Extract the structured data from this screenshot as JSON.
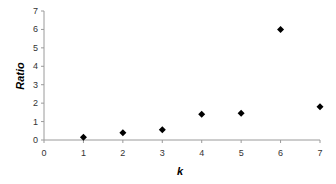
{
  "chart_data": {
    "type": "scatter",
    "title": "",
    "xlabel": "k",
    "ylabel": "Ratio",
    "x": [
      1,
      2,
      3,
      4,
      5,
      6,
      7
    ],
    "series": [
      {
        "name": "Ratio",
        "values": [
          0.15,
          0.4,
          0.55,
          1.4,
          1.45,
          6.0,
          1.8
        ],
        "marker": "diamond",
        "color": "#000000"
      }
    ],
    "xlim": [
      0,
      7
    ],
    "ylim": [
      0,
      7
    ],
    "xticks": [
      "0",
      "1",
      "2",
      "3",
      "4",
      "5",
      "6",
      "7"
    ],
    "yticks": [
      "0",
      "1",
      "2",
      "3",
      "4",
      "5",
      "6",
      "7"
    ],
    "grid": false,
    "legend": null,
    "axis_color": "#9a9a9a"
  }
}
